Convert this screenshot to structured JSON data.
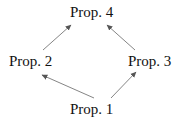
{
  "diagram": {
    "nodes": [
      {
        "id": "p4",
        "label": "Prop. 4"
      },
      {
        "id": "p2",
        "label": "Prop. 2"
      },
      {
        "id": "p3",
        "label": "Prop. 3"
      },
      {
        "id": "p1",
        "label": "Prop. 1"
      }
    ],
    "edges": [
      {
        "from": "Prop. 1",
        "to": "Prop. 2"
      },
      {
        "from": "Prop. 1",
        "to": "Prop. 3"
      },
      {
        "from": "Prop. 2",
        "to": "Prop. 4"
      },
      {
        "from": "Prop. 3",
        "to": "Prop. 4"
      }
    ],
    "colors": {
      "text": "#111111",
      "arrow": "#666666",
      "background": "#ffffff"
    }
  }
}
